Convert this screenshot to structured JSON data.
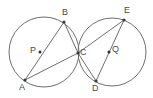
{
  "figure": {
    "background_color": "#ffffff",
    "stroke_color": "#6e6e6e",
    "label_color": "#4a4a4a",
    "width": 153,
    "height": 98
  },
  "chart_data": {
    "type": "diagram",
    "circles": [
      {
        "name": "circle-P",
        "center_label": "P",
        "cx": 44,
        "cy": 52,
        "r": 35
      },
      {
        "name": "circle-Q",
        "center_label": "Q",
        "cx": 112,
        "cy": 52,
        "r": 34
      }
    ],
    "centers": [
      {
        "label": "P",
        "x": 40,
        "y": 52,
        "label_x": 30,
        "label_y": 46
      },
      {
        "label": "Q",
        "x": 109,
        "y": 52,
        "label_x": 112,
        "label_y": 45
      }
    ],
    "points": [
      {
        "label": "A",
        "x": 25,
        "y": 80,
        "label_x": 19,
        "label_y": 83
      },
      {
        "label": "B",
        "x": 64,
        "y": 22,
        "label_x": 62,
        "label_y": 8
      },
      {
        "label": "C",
        "x": 78,
        "y": 53,
        "label_x": 80,
        "label_y": 48
      },
      {
        "label": "D",
        "x": 96,
        "y": 81,
        "label_x": 92,
        "label_y": 84
      },
      {
        "label": "E",
        "x": 124,
        "y": 20,
        "label_x": 124,
        "label_y": 6
      }
    ],
    "segments": [
      {
        "name": "segment-AB",
        "from": "A",
        "to": "B",
        "x1": 25,
        "y1": 80,
        "x2": 64,
        "y2": 22
      },
      {
        "name": "segment-BC",
        "from": "B",
        "to": "C",
        "x1": 64,
        "y1": 22,
        "x2": 78,
        "y2": 53
      },
      {
        "name": "segment-AC",
        "from": "A",
        "to": "C",
        "x1": 25,
        "y1": 80,
        "x2": 78,
        "y2": 53
      },
      {
        "name": "segment-CE",
        "from": "C",
        "to": "E",
        "x1": 78,
        "y1": 53,
        "x2": 124,
        "y2": 20
      },
      {
        "name": "segment-CD",
        "from": "C",
        "to": "D",
        "x1": 78,
        "y1": 53,
        "x2": 96,
        "y2": 81
      },
      {
        "name": "segment-DE",
        "from": "D",
        "to": "E",
        "x1": 96,
        "y1": 81,
        "x2": 124,
        "y2": 20
      }
    ],
    "tangency": {
      "point": "C",
      "x": 78,
      "y": 52,
      "description": "circles P and Q are externally tangent at C"
    },
    "labels": [
      "A",
      "B",
      "C",
      "D",
      "E",
      "P",
      "Q"
    ]
  }
}
